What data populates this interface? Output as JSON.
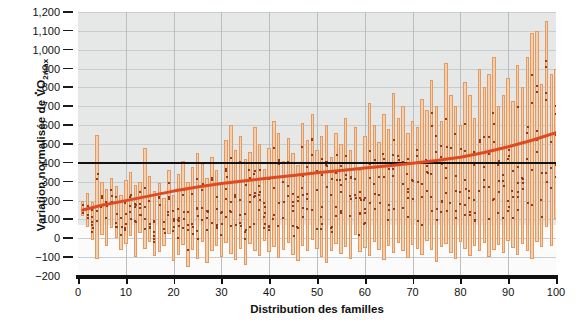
{
  "chart_data": {
    "type": "bar",
    "title": "",
    "subtitle": "",
    "xlabel": "Distribution des familles",
    "ylabel": "Variation normalisée de V̇O2max",
    "ylabel_parts": {
      "prefix": "Variation normalisée de ",
      "v": "V",
      "o": "O",
      "sub": "2max"
    },
    "xlim": [
      0,
      100
    ],
    "ylim": [
      -200,
      1200
    ],
    "xticks": [
      0,
      10,
      20,
      30,
      40,
      50,
      60,
      70,
      80,
      90,
      100
    ],
    "xtick_labels": [
      "0",
      "10",
      "20",
      "30",
      "40",
      "50",
      "60",
      "70",
      "80",
      "90",
      "100"
    ],
    "yticks": [
      -200,
      -100,
      0,
      100,
      200,
      300,
      400,
      500,
      600,
      700,
      800,
      900,
      1000,
      1100,
      1200
    ],
    "ytick_labels": [
      "−200",
      "−100",
      "0",
      "100",
      "200",
      "300",
      "400",
      "500",
      "600",
      "700",
      "800",
      "900",
      "1,000",
      "1,100",
      "1,200"
    ],
    "grid": true,
    "legend": "none",
    "reference_line": {
      "value": 400,
      "color": "#111111",
      "label": ""
    },
    "colors": {
      "bar_fill": "#f7cfac",
      "bar_edge": "#e09a62",
      "dot": "#9d3414",
      "trend": "#e04a20",
      "reference": "#111111",
      "plot_background": "#e6e8e8",
      "grid": "#c7cccd",
      "axis": "#111111"
    },
    "series": [
      {
        "name": "Variation par famille (étendue)",
        "type": "range-bars",
        "x": [
          1,
          2,
          3,
          4,
          5,
          6,
          7,
          8,
          9,
          10,
          11,
          12,
          13,
          14,
          15,
          16,
          17,
          18,
          19,
          20,
          21,
          22,
          23,
          24,
          25,
          26,
          27,
          28,
          29,
          30,
          31,
          32,
          33,
          34,
          35,
          36,
          37,
          38,
          39,
          40,
          41,
          42,
          43,
          44,
          45,
          46,
          47,
          48,
          49,
          50,
          51,
          52,
          53,
          54,
          55,
          56,
          57,
          58,
          59,
          60,
          61,
          62,
          63,
          64,
          65,
          66,
          67,
          68,
          69,
          70,
          71,
          72,
          73,
          74,
          75,
          76,
          77,
          78,
          79,
          80,
          81,
          82,
          83,
          84,
          85,
          86,
          87,
          88,
          89,
          90,
          91,
          92,
          93,
          94,
          95,
          96,
          97,
          98,
          99,
          100
        ],
        "low": [
          120,
          60,
          -10,
          -110,
          20,
          -40,
          55,
          0,
          -60,
          -30,
          10,
          -100,
          30,
          -55,
          -20,
          -95,
          -75,
          -40,
          25,
          -120,
          -90,
          -35,
          -150,
          -60,
          -110,
          -20,
          -130,
          -70,
          -40,
          -100,
          -25,
          -85,
          -115,
          -55,
          -140,
          -30,
          -65,
          -95,
          -15,
          -75,
          -45,
          -105,
          -60,
          -25,
          -90,
          -120,
          -40,
          -70,
          -10,
          -55,
          -100,
          -130,
          -65,
          -30,
          -85,
          -45,
          -110,
          20,
          -75,
          -50,
          -95,
          -20,
          -60,
          -115,
          -40,
          -80,
          -25,
          -70,
          -105,
          -35,
          -55,
          -90,
          -15,
          -60,
          -125,
          -45,
          -30,
          -80,
          -110,
          -20,
          -55,
          -95,
          -40,
          -70,
          -25,
          -100,
          -60,
          -35,
          -80,
          -15,
          -50,
          -90,
          -30,
          -65,
          -110,
          -20,
          -45,
          60,
          -40,
          100,
          380
        ],
        "high": [
          200,
          240,
          190,
          550,
          300,
          260,
          320,
          275,
          230,
          310,
          350,
          285,
          300,
          480,
          330,
          250,
          295,
          215,
          360,
          230,
          340,
          410,
          300,
          380,
          450,
          395,
          320,
          430,
          360,
          290,
          520,
          600,
          470,
          540,
          420,
          460,
          590,
          500,
          370,
          480,
          620,
          560,
          410,
          530,
          450,
          390,
          610,
          520,
          660,
          470,
          545,
          600,
          430,
          560,
          500,
          640,
          470,
          590,
          360,
          540,
          720,
          600,
          510,
          660,
          580,
          770,
          640,
          700,
          560,
          620,
          590,
          740,
          680,
          840,
          700,
          620,
          930,
          760,
          700,
          600,
          830,
          760,
          640,
          900,
          800,
          870,
          960,
          700,
          760,
          850,
          730,
          920,
          800,
          960,
          1090,
          1100,
          820,
          1150,
          870,
          900
        ]
      },
      {
        "name": "Tendance moyenne",
        "type": "line",
        "x": [
          1,
          5,
          10,
          15,
          20,
          25,
          30,
          35,
          40,
          45,
          50,
          55,
          60,
          65,
          70,
          75,
          80,
          85,
          90,
          95,
          100
        ],
        "y": [
          150,
          175,
          200,
          225,
          250,
          272,
          290,
          305,
          320,
          333,
          348,
          360,
          372,
          385,
          398,
          412,
          430,
          455,
          485,
          520,
          560
        ]
      }
    ],
    "note": "Chaque barre représente l'étendue de la variation d'une famille; les points rouges sont les membres de la famille."
  }
}
